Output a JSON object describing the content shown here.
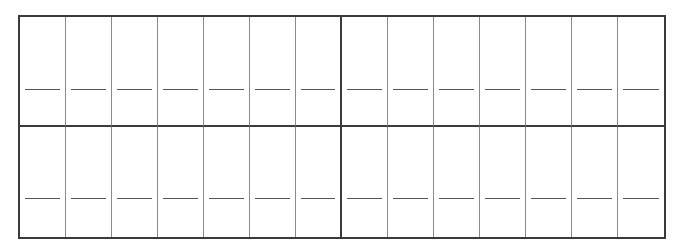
{
  "worksheet": {
    "layout": {
      "rows": 2,
      "columns_per_row": 14,
      "group_size": 7
    },
    "colors": {
      "border": "#3a3a3a",
      "divider": "#8a8a8a",
      "line": "#555555",
      "background": "#ffffff"
    },
    "rows": [
      {
        "cells": [
          "",
          "",
          "",
          "",
          "",
          "",
          "",
          "",
          "",
          "",
          "",
          "",
          "",
          ""
        ]
      },
      {
        "cells": [
          "",
          "",
          "",
          "",
          "",
          "",
          "",
          "",
          "",
          "",
          "",
          "",
          "",
          ""
        ]
      }
    ]
  }
}
